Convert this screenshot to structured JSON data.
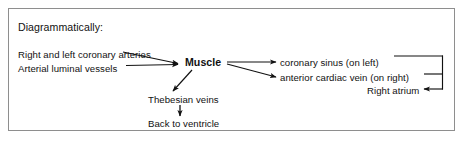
{
  "figure": {
    "heading": "Diagrammatically:",
    "sources": [
      {
        "id": "coronary_arteries",
        "label": "Right and left coronary arteries"
      },
      {
        "id": "luminal_vessels",
        "label": "Arterial luminal vessels"
      }
    ],
    "center_node": {
      "id": "muscle",
      "label": "Muscle",
      "emphasis": "bold"
    },
    "outputs": [
      {
        "id": "coronary_sinus",
        "label": "coronary sinus (on left)"
      },
      {
        "id": "anterior_cardiac_vein",
        "label": "anterior cardiac vein (on right)"
      },
      {
        "id": "right_atrium",
        "label": "Right atrium"
      }
    ],
    "branch": [
      {
        "id": "thebesian_veins",
        "label": "Thebesian veins"
      },
      {
        "id": "back_to_ventricle",
        "label": "Back to ventricle"
      }
    ],
    "colors": {
      "ink": "#111111",
      "border": "#8e8e8e",
      "background": "#ffffff"
    }
  }
}
